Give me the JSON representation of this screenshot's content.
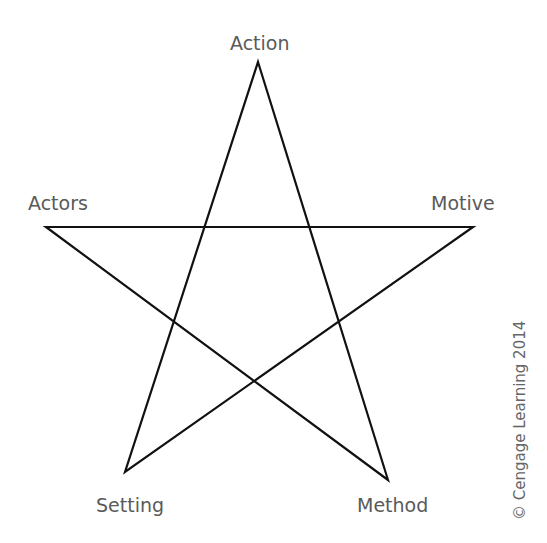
{
  "diagram": {
    "type": "pentagram",
    "labels": {
      "top": "Action",
      "left": "Actors",
      "right": "Motive",
      "bottom_left": "Setting",
      "bottom_right": "Method"
    },
    "credit": "© Cengage Learning 2014",
    "line_color": "#111111",
    "label_color": "#5a5a5a"
  }
}
